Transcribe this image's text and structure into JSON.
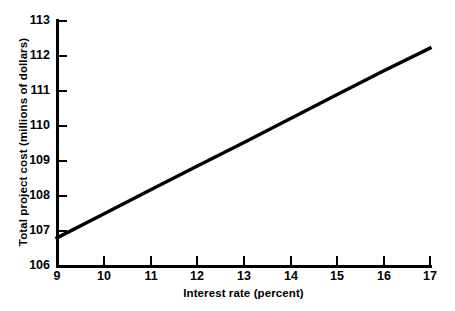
{
  "chart_data": {
    "type": "line",
    "title": "",
    "xlabel": "Interest rate (percent)",
    "ylabel": "Total project cost (millions of dollars)",
    "xlim": [
      9,
      17
    ],
    "ylim": [
      106,
      113
    ],
    "grid": false,
    "legend": null,
    "x_ticks": [
      "9",
      "10",
      "11",
      "12",
      "13",
      "14",
      "15",
      "16",
      "17"
    ],
    "y_ticks": [
      "106",
      "107",
      "108",
      "109",
      "110",
      "111",
      "112",
      "113"
    ],
    "series": [
      {
        "name": "Total project cost",
        "color": "#000000",
        "x": [
          9,
          10,
          11,
          12,
          13,
          14,
          15,
          16,
          17
        ],
        "values": [
          106.8,
          107.48,
          108.16,
          108.84,
          109.51,
          110.19,
          110.87,
          111.55,
          112.2
        ]
      }
    ]
  }
}
